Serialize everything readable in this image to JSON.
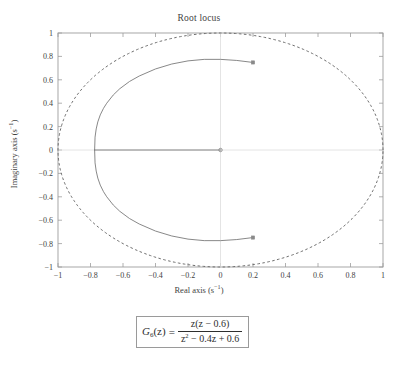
{
  "figure": {
    "title": "Root locus",
    "xlabel_text": "Real axis (s",
    "xlabel_exp": "−1",
    "xlabel_tail": ")",
    "ylabel_text": "Imaginary axis (s",
    "ylabel_exp": "−1",
    "ylabel_tail": ")"
  },
  "formula": {
    "lhs": "G",
    "lhs_sub": "6",
    "lhs_tail": "(z)",
    "equals": "=",
    "numerator": "z(z − 0.6)",
    "denominator_a": "z",
    "denominator_exp": "2",
    "denominator_b": " − 0.4z + 0.6"
  },
  "chart_data": {
    "type": "line",
    "title": "Root locus",
    "xlabel": "Real axis (s⁻¹)",
    "ylabel": "Imaginary axis (s⁻¹)",
    "xlim": [
      -1,
      1
    ],
    "ylim": [
      -1,
      1
    ],
    "grid": false,
    "legend": "none",
    "xticks": [
      -1,
      -0.8,
      -0.6,
      -0.4,
      -0.2,
      0,
      0.2,
      0.4,
      0.6,
      0.8,
      1
    ],
    "xticklabels": [
      "−1",
      "−0.8",
      "−0.6",
      "−0.4",
      "−0.2",
      "0",
      "0.2",
      "0.4",
      "0.6",
      "0.8",
      "1"
    ],
    "yticks": [
      1,
      0.8,
      0.6,
      0.4,
      0.2,
      0,
      -0.2,
      -0.4,
      -0.6,
      -0.8,
      -1
    ],
    "yticklabels": [
      "1",
      "0.8",
      "0.6",
      "0.4",
      "0.2",
      "0",
      "−0.2",
      "−0.4",
      "−0.6",
      "−0.8",
      "−1"
    ],
    "transfer_function": "G6(z) = z(z-0.6) / (z^2 - 0.4z + 0.6)",
    "series": [
      {
        "name": "unit-circle",
        "style": "dashed",
        "color": "#6e6e6e",
        "type": "circle",
        "center": [
          0,
          0
        ],
        "radius": 1
      },
      {
        "name": "root-locus-upper-branch",
        "style": "solid",
        "color": "#7a7a7a",
        "points": [
          [
            0.2,
            0.7483
          ],
          [
            0.1,
            0.7655
          ],
          [
            0.0,
            0.7746
          ],
          [
            -0.1,
            0.7746
          ],
          [
            -0.2,
            0.7616
          ],
          [
            -0.3,
            0.7348
          ],
          [
            -0.4,
            0.6928
          ],
          [
            -0.5,
            0.6325
          ],
          [
            -0.56,
            0.5857
          ],
          [
            -0.62,
            0.5238
          ],
          [
            -0.66,
            0.4702
          ],
          [
            -0.7,
            0.4
          ],
          [
            -0.72,
            0.3564
          ],
          [
            -0.74,
            0.3
          ],
          [
            -0.755,
            0.24
          ],
          [
            -0.765,
            0.18
          ],
          [
            -0.772,
            0.11
          ],
          [
            -0.7746,
            0.0
          ]
        ]
      },
      {
        "name": "root-locus-lower-branch",
        "style": "solid",
        "color": "#7a7a7a",
        "points": [
          [
            0.2,
            -0.7483
          ],
          [
            0.1,
            -0.7655
          ],
          [
            0.0,
            -0.7746
          ],
          [
            -0.1,
            -0.7746
          ],
          [
            -0.2,
            -0.7616
          ],
          [
            -0.3,
            -0.7348
          ],
          [
            -0.4,
            -0.6928
          ],
          [
            -0.5,
            -0.6325
          ],
          [
            -0.56,
            -0.5857
          ],
          [
            -0.62,
            -0.5238
          ],
          [
            -0.66,
            -0.4702
          ],
          [
            -0.7,
            -0.4
          ],
          [
            -0.72,
            -0.3564
          ],
          [
            -0.74,
            -0.3
          ],
          [
            -0.755,
            -0.24
          ],
          [
            -0.765,
            -0.18
          ],
          [
            -0.772,
            -0.11
          ],
          [
            -0.7746,
            0.0
          ]
        ]
      },
      {
        "name": "root-locus-real-axis-segment",
        "style": "solid",
        "color": "#7a7a7a",
        "points": [
          [
            -0.7746,
            0.0
          ],
          [
            0.0,
            0.0
          ]
        ]
      }
    ],
    "markers": [
      {
        "name": "zero-at-origin",
        "x": 0.0,
        "y": 0.0,
        "shape": "o"
      },
      {
        "name": "pole-branch-end-upper",
        "x": 0.2,
        "y": 0.7483,
        "shape": "square"
      },
      {
        "name": "pole-branch-end-lower",
        "x": 0.2,
        "y": -0.7483,
        "shape": "square"
      }
    ]
  }
}
